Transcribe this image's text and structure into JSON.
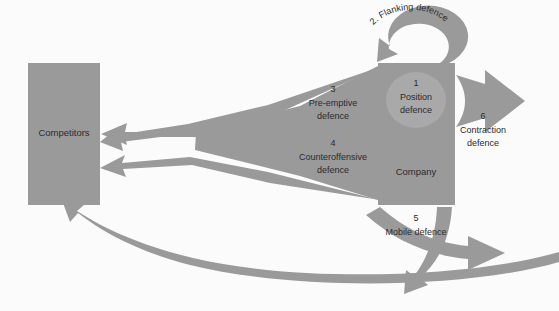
{
  "figure": {
    "background_color": "#fbfbfb",
    "shape_fill": "#9a9a9a",
    "circle_fill": "#a9a9a9",
    "text_color": "#2b2b2b"
  },
  "boxes": {
    "competitors": {
      "label": "Competitors"
    },
    "company": {
      "label": "Company"
    }
  },
  "circle": {
    "number": "1",
    "line1": "Position",
    "line2": "defence"
  },
  "strategies": {
    "flanking": {
      "text": "2. Flanking defence"
    },
    "preemptive": {
      "number": "3",
      "line1": "Pre-emptive",
      "line2": "defence"
    },
    "counteroffensive": {
      "number": "4",
      "line1": "Counteroffensive",
      "line2": "defence"
    },
    "mobile": {
      "number": "5",
      "line1": "Mobile defence"
    },
    "contraction": {
      "number": "6",
      "line1": "Contraction",
      "line2": "defence"
    }
  }
}
